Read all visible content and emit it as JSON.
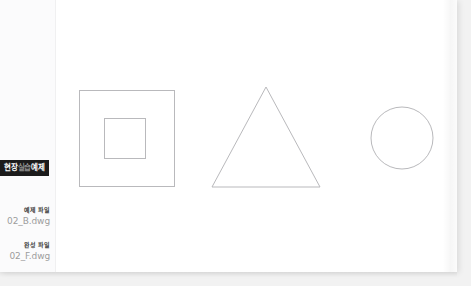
{
  "page": {
    "background_color": "#f2f2f2",
    "sheet_color": "#ffffff"
  },
  "margin": {
    "banner": {
      "full_text": "현장실습예제",
      "segment_strong_1": "현장",
      "segment_dim": "실습",
      "segment_strong_2": "예제",
      "background_color": "#1b1b1b",
      "text_color": "#ffffff",
      "dim_text_color": "#8e8e8e"
    },
    "file_refs": [
      {
        "kicker": "예제 파일",
        "filename": "02_B.dwg"
      },
      {
        "kicker": "완성 파일",
        "filename": "02_F.dwg"
      }
    ]
  },
  "figure": {
    "stroke_color": "#b9b9bc",
    "shapes": [
      {
        "name": "outer-square",
        "type": "rect",
        "x": 23,
        "y": 90,
        "width": 95,
        "height": 96
      },
      {
        "name": "inner-square",
        "type": "rect",
        "x": 48,
        "y": 118,
        "width": 41,
        "height": 40
      },
      {
        "name": "triangle",
        "type": "polygon",
        "points": "210,87 264,187 156,187"
      },
      {
        "name": "circle",
        "type": "circle",
        "cx": 346,
        "cy": 138,
        "r": 31
      }
    ]
  }
}
